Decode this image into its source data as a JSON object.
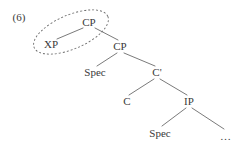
{
  "figure": {
    "example_number": "(6)",
    "background_color": "#ffffff",
    "line_color": "#6b6b6b",
    "text_color": "#3a3a3a",
    "highlight_shape": "dashed-ellipse"
  },
  "tree": {
    "nodes": [
      {
        "id": "cp-top",
        "label": "CP",
        "x": 89,
        "y": 22
      },
      {
        "id": "xp",
        "label": "XP",
        "x": 51,
        "y": 44
      },
      {
        "id": "cp-lower",
        "label": "CP",
        "x": 120,
        "y": 46
      },
      {
        "id": "spec-cp",
        "label": "Spec",
        "x": 95,
        "y": 72
      },
      {
        "id": "c-bar",
        "label": "C'",
        "x": 157,
        "y": 72
      },
      {
        "id": "c-head",
        "label": "C",
        "x": 127,
        "y": 101
      },
      {
        "id": "ip",
        "label": "IP",
        "x": 189,
        "y": 101
      },
      {
        "id": "spec-ip",
        "label": "Spec",
        "x": 160,
        "y": 133
      },
      {
        "id": "ellipsis",
        "label": "…",
        "x": 226,
        "y": 136
      }
    ],
    "edges": [
      {
        "id": "edge-cptop-xp",
        "from": "cp-top",
        "to": "xp",
        "x1": 83,
        "y1": 28,
        "x2": 57,
        "y2": 39
      },
      {
        "id": "edge-cptop-cplower",
        "from": "cp-top",
        "to": "cp-lower",
        "x1": 95,
        "y1": 28,
        "x2": 118,
        "y2": 40
      },
      {
        "id": "edge-cplower-spec",
        "from": "cp-lower",
        "to": "spec-cp",
        "x1": 117,
        "y1": 53,
        "x2": 97,
        "y2": 66
      },
      {
        "id": "edge-cplower-cbar",
        "from": "cp-lower",
        "to": "c-bar",
        "x1": 124,
        "y1": 53,
        "x2": 155,
        "y2": 66
      },
      {
        "id": "edge-cbar-c",
        "from": "c-bar",
        "to": "c-head",
        "x1": 154,
        "y1": 79,
        "x2": 129,
        "y2": 95
      },
      {
        "id": "edge-cbar-ip",
        "from": "c-bar",
        "to": "ip",
        "x1": 160,
        "y1": 79,
        "x2": 187,
        "y2": 95
      },
      {
        "id": "edge-ip-specip",
        "from": "ip",
        "to": "spec-ip",
        "x1": 186,
        "y1": 108,
        "x2": 162,
        "y2": 126
      },
      {
        "id": "edge-ip-ellipsis",
        "from": "ip",
        "to": "ellipsis",
        "x1": 192,
        "y1": 108,
        "x2": 224,
        "y2": 129
      }
    ],
    "highlight": {
      "id": "constituent-circle",
      "cx": 71,
      "cy": 32,
      "rx": 40,
      "ry": 17,
      "rotation_deg": -23,
      "dash": "2 2",
      "encircles": [
        "cp-top",
        "xp"
      ]
    }
  }
}
